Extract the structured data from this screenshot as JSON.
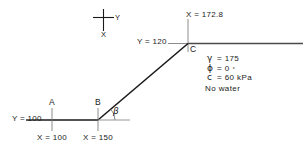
{
  "figure": {
    "type": "slope-stability-cross-section",
    "orientation_key": {
      "y_axis_label": "Y",
      "x_axis_label": "X"
    },
    "points": {
      "A": {
        "label": "A",
        "x_label": "X = 100",
        "y_label": "Y = 100",
        "x_value": 100,
        "y_value": 100
      },
      "B": {
        "label": "B",
        "x_label": "X = 150",
        "x_value": 150,
        "y_value": 100
      },
      "C": {
        "label": "C",
        "x_label": "X = 172.8",
        "y_label": "Y = 120",
        "x_value": 172.8,
        "y_value": 120
      }
    },
    "angle": {
      "label": "β",
      "name": "beta-slope-angle"
    },
    "soil_properties": [
      {
        "symbol": "γ",
        "equals": "=",
        "value": "175",
        "name": "unit-weight"
      },
      {
        "symbol": "ϕ",
        "equals": "=",
        "value": "0",
        "degree": "°",
        "name": "friction-angle"
      },
      {
        "symbol": "c",
        "equals": "=",
        "value": "60 kPa",
        "name": "cohesion"
      }
    ],
    "water_note": "No  water"
  },
  "colors": {
    "ink": "#1a1a1a",
    "ground_line": "#6e6e6e",
    "background": "#ffffff"
  }
}
